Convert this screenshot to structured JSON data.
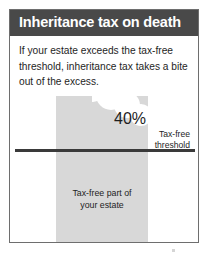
{
  "card": {
    "header": {
      "title": "Inheritance tax on death"
    },
    "intro": "If your estate exceeds the tax-free threshold, inheritance tax takes a bite out of the excess."
  },
  "chart_data": {
    "type": "bar",
    "title": "Inheritance tax on death",
    "categories": [
      "Your estate"
    ],
    "values": [
      100
    ],
    "xlabel": "",
    "ylabel": "",
    "grid": false,
    "legend": null,
    "annotations": [
      {
        "name": "tax-rate",
        "text": "40%",
        "note": "Rate of inheritance tax applied to the portion of the estate above the threshold"
      },
      {
        "name": "threshold-marker",
        "line1": "Tax-free",
        "line2": "threshold",
        "note": "Horizontal rule marking the nil-rate band"
      },
      {
        "name": "tax-free-portion",
        "line1": "Tax-free part of",
        "line2": "your estate",
        "note": "Shaded area below the threshold line"
      }
    ],
    "colors": {
      "header": "#494949",
      "estate_bar": "#d8d8d8",
      "threshold_line": "#3a3a3a",
      "card_border": "#6e6e6e",
      "text": "#1e1e1e"
    }
  }
}
